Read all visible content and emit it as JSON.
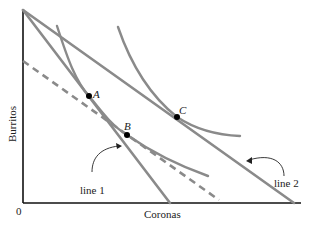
{
  "diagram": {
    "axes": {
      "x_label": "Coronas",
      "y_label": "Burritos",
      "origin_label": "0"
    },
    "points": [
      {
        "label": "A",
        "x": 89,
        "y": 96
      },
      {
        "label": "B",
        "x": 127,
        "y": 135
      },
      {
        "label": "C",
        "x": 177,
        "y": 117
      }
    ],
    "lines": [
      {
        "label": "line 1",
        "style": "solid"
      },
      {
        "label": "line 2",
        "style": "solid"
      },
      {
        "label": "",
        "style": "dashed"
      }
    ],
    "indifference_curves": [
      {
        "name": "lower curve",
        "passes_through": [
          "A",
          "B"
        ]
      },
      {
        "name": "upper curve",
        "passes_through": [
          "C"
        ]
      }
    ],
    "colors": {
      "curve": "#8a8a8a",
      "axis": "#111111",
      "point": "#000000"
    }
  }
}
